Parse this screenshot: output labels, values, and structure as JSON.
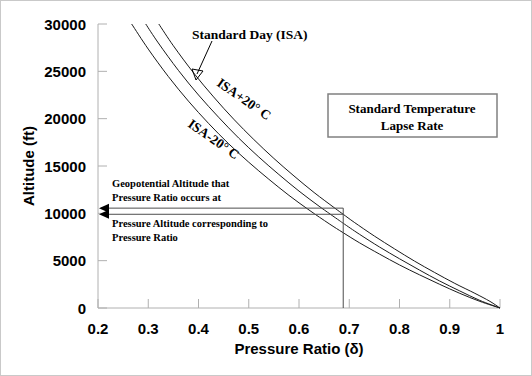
{
  "chart_data": {
    "type": "line",
    "title": "",
    "xlabel": "Pressure Ratio (δ)",
    "ylabel": "Altitude (ft)",
    "xlim": [
      0.2,
      1.0
    ],
    "ylim": [
      0,
      30000
    ],
    "grid": false,
    "legend_position": "none",
    "x_ticks": [
      "0.2",
      "0.3",
      "0.4",
      "0.5",
      "0.6",
      "0.7",
      "0.8",
      "0.9",
      "1"
    ],
    "x_tick_values": [
      0.2,
      0.3,
      0.4,
      0.5,
      0.6,
      0.7,
      0.8,
      0.9,
      1.0
    ],
    "y_ticks": [
      "0",
      "5000",
      "10000",
      "15000",
      "20000",
      "25000",
      "30000"
    ],
    "y_tick_values": [
      0,
      5000,
      10000,
      15000,
      20000,
      25000,
      30000
    ],
    "series": [
      {
        "name": "ISA-20° C",
        "label": "ISA-20° C",
        "points": [
          [
            0.267,
            30000
          ],
          [
            0.3,
            27350
          ],
          [
            0.34,
            24450
          ],
          [
            0.38,
            21850
          ],
          [
            0.42,
            19500
          ],
          [
            0.46,
            17350
          ],
          [
            0.5,
            15400
          ],
          [
            0.54,
            13600
          ],
          [
            0.58,
            11900
          ],
          [
            0.62,
            10350
          ],
          [
            0.66,
            8900
          ],
          [
            0.688,
            7950
          ],
          [
            0.72,
            6900
          ],
          [
            0.76,
            5700
          ],
          [
            0.8,
            4550
          ],
          [
            0.84,
            3500
          ],
          [
            0.88,
            2500
          ],
          [
            0.92,
            1550
          ],
          [
            0.96,
            700
          ],
          [
            1.0,
            0
          ]
        ]
      },
      {
        "name": "Standard Day (ISA)",
        "label": "Standard Day (ISA)",
        "points": [
          [
            0.295,
            30000
          ],
          [
            0.32,
            28000
          ],
          [
            0.36,
            25100
          ],
          [
            0.4,
            22500
          ],
          [
            0.44,
            20150
          ],
          [
            0.48,
            17950
          ],
          [
            0.52,
            15950
          ],
          [
            0.56,
            14100
          ],
          [
            0.6,
            12350
          ],
          [
            0.64,
            10750
          ],
          [
            0.68,
            9250
          ],
          [
            0.688,
            8950
          ],
          [
            0.72,
            7800
          ],
          [
            0.76,
            6450
          ],
          [
            0.8,
            5200
          ],
          [
            0.84,
            4000
          ],
          [
            0.88,
            2850
          ],
          [
            0.92,
            1800
          ],
          [
            0.96,
            800
          ],
          [
            1.0,
            0
          ]
        ]
      },
      {
        "name": "ISA+20° C",
        "label": "ISA+20° C",
        "points": [
          [
            0.321,
            30000
          ],
          [
            0.35,
            27700
          ],
          [
            0.39,
            24850
          ],
          [
            0.43,
            22300
          ],
          [
            0.47,
            19950
          ],
          [
            0.51,
            17800
          ],
          [
            0.55,
            15800
          ],
          [
            0.59,
            13950
          ],
          [
            0.63,
            12200
          ],
          [
            0.67,
            10600
          ],
          [
            0.688,
            9900
          ],
          [
            0.71,
            9050
          ],
          [
            0.75,
            7600
          ],
          [
            0.79,
            6250
          ],
          [
            0.83,
            4950
          ],
          [
            0.87,
            3750
          ],
          [
            0.91,
            2600
          ],
          [
            0.95,
            1550
          ],
          [
            0.98,
            700
          ],
          [
            1.0,
            0
          ]
        ]
      }
    ],
    "annotations": {
      "standard_day": {
        "label": "Standard Day (ISA)",
        "arrow_target_x": 0.39,
        "arrow_target_y": 23900
      },
      "isa_plus": {
        "label": "ISA+20° C"
      },
      "isa_minus": {
        "label": "ISA-20° C"
      },
      "geopotential": {
        "line1": "Geopotential Altitude that",
        "line2": "Pressure Ratio occurs at",
        "altitude": 10550
      },
      "pressure_altitude": {
        "line1": "Pressure Altitude corresponding to",
        "line2": "Pressure Ratio",
        "altitude": 9900
      },
      "marker_pressure_ratio": 0.688
    },
    "legend_box": {
      "line1": "Standard Temperature",
      "line2": "Lapse Rate"
    }
  },
  "colors": {
    "curve": "#1a1a1a",
    "axis": "#b0b0b0",
    "guide": "#4d4d4d",
    "text": "#000000",
    "background": "#ffffff"
  }
}
